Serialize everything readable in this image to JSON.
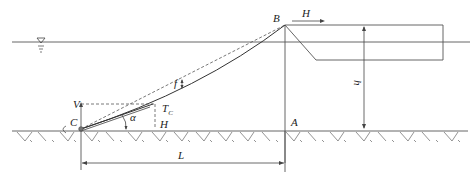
{
  "figure": {
    "labels": {
      "B": "B",
      "H_top": "H",
      "h": "h",
      "f": "f",
      "V": "V",
      "T": "T",
      "T_sub": "C",
      "alpha": "α",
      "C": "C",
      "H_bottom": "H",
      "A": "A",
      "L": "L"
    },
    "symbols": {
      "water_level": "water-level-triangle"
    },
    "colors": {
      "line": "#555555",
      "text": "#222222",
      "background": "#ffffff"
    }
  }
}
